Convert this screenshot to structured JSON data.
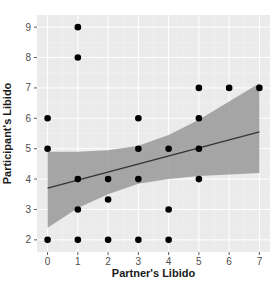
{
  "chart_data": {
    "type": "scatter",
    "title": "",
    "xlabel": "Partner's Libido",
    "ylabel": "Participant's Libido",
    "xlim": [
      -0.35,
      7.35
    ],
    "ylim": [
      1.6,
      9.4
    ],
    "x_ticks": [
      0,
      1,
      2,
      3,
      4,
      5,
      6,
      7
    ],
    "y_ticks": [
      2,
      3,
      4,
      5,
      6,
      7,
      8,
      9
    ],
    "grid": true,
    "legend": null,
    "points": [
      {
        "x": 0,
        "y": 6
      },
      {
        "x": 0,
        "y": 5
      },
      {
        "x": 0,
        "y": 2
      },
      {
        "x": 1,
        "y": 9
      },
      {
        "x": 1,
        "y": 8
      },
      {
        "x": 1,
        "y": 4
      },
      {
        "x": 1,
        "y": 3
      },
      {
        "x": 1,
        "y": 2
      },
      {
        "x": 2,
        "y": 4
      },
      {
        "x": 2,
        "y": 3.33
      },
      {
        "x": 2,
        "y": 2
      },
      {
        "x": 3,
        "y": 6
      },
      {
        "x": 3,
        "y": 5
      },
      {
        "x": 3,
        "y": 4
      },
      {
        "x": 3,
        "y": 2
      },
      {
        "x": 4,
        "y": 5
      },
      {
        "x": 4,
        "y": 3
      },
      {
        "x": 4,
        "y": 2
      },
      {
        "x": 5,
        "y": 7
      },
      {
        "x": 5,
        "y": 6
      },
      {
        "x": 5,
        "y": 5
      },
      {
        "x": 5,
        "y": 4
      },
      {
        "x": 6,
        "y": 7
      },
      {
        "x": 7,
        "y": 7
      }
    ],
    "regression_line": {
      "x": [
        0,
        7
      ],
      "y": [
        3.7,
        5.55
      ]
    },
    "confidence_band": {
      "x": [
        0,
        1,
        2,
        3,
        4,
        5,
        6,
        7
      ],
      "lower": [
        2.4,
        3.05,
        3.5,
        3.85,
        4.0,
        4.1,
        4.15,
        4.2
      ],
      "upper": [
        4.9,
        4.9,
        4.95,
        5.1,
        5.45,
        5.95,
        6.55,
        7.15
      ]
    },
    "colors": {
      "panel_bg": "#ebebeb",
      "grid": "#ffffff",
      "band": "#999999",
      "line": "#333333",
      "point": "#000000"
    }
  }
}
